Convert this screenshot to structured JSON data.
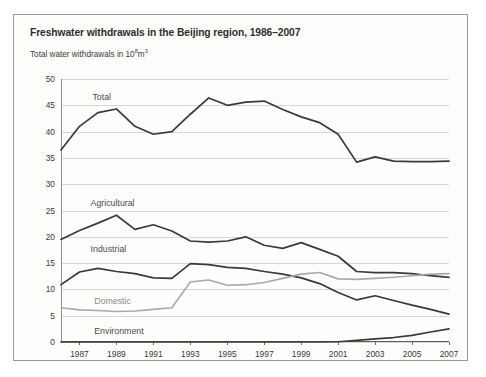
{
  "figure": {
    "title": "Freshwater withdrawals in the Beijing region, 1986–2007",
    "subtitle_prefix": "Total water withdrawals in 10",
    "subtitle_exp1": "8",
    "subtitle_mid": "m",
    "subtitle_exp2": "3"
  },
  "chart_data": {
    "type": "line",
    "title": "Freshwater withdrawals in the Beijing region, 1986–2007",
    "subtitle": "Total water withdrawals in 10⁸m³",
    "xlabel": "",
    "ylabel": "",
    "ylim": [
      0,
      50
    ],
    "ytick_values": [
      0,
      5,
      10,
      15,
      20,
      25,
      30,
      35,
      40,
      45,
      50
    ],
    "ytick_labels": [
      "0",
      "5",
      "10",
      "15",
      "20",
      "25",
      "30",
      "35",
      "40",
      "45",
      "50"
    ],
    "xlim": [
      1986,
      2007
    ],
    "x": [
      1986,
      1987,
      1988,
      1989,
      1990,
      1991,
      1992,
      1993,
      1994,
      1995,
      1996,
      1997,
      1998,
      1999,
      2000,
      2001,
      2002,
      2003,
      2004,
      2005,
      2006,
      2007
    ],
    "xtick_values": [
      1987,
      1989,
      1991,
      1993,
      1995,
      1997,
      1999,
      2001,
      2003,
      2005,
      2007
    ],
    "xtick_labels": [
      "1987",
      "1989",
      "1991",
      "1993",
      "1995",
      "1997",
      "1999",
      "2001",
      "2003",
      "2005",
      "2007"
    ],
    "grid": true,
    "grid_axis": "y",
    "legend_position": "inline-labels",
    "series": [
      {
        "name": "Total",
        "color": "#3a3a38",
        "width": 1.7,
        "label_x": 1987.7,
        "label_y": 46.6,
        "values": [
          36.5,
          41.0,
          43.6,
          44.3,
          41.0,
          39.5,
          40.0,
          43.3,
          46.4,
          45.0,
          45.6,
          45.8,
          44.2,
          42.8,
          41.7,
          39.5,
          34.2,
          35.2,
          34.4,
          34.3,
          34.3,
          34.4
        ]
      },
      {
        "name": "Agricultural",
        "color": "#3a3a38",
        "width": 1.7,
        "label_x": 1987.6,
        "label_y": 26.4,
        "values": [
          19.5,
          21.2,
          22.6,
          24.1,
          21.4,
          22.3,
          21.1,
          19.2,
          19.0,
          19.2,
          20.0,
          18.4,
          17.8,
          18.9,
          17.6,
          16.3,
          13.4,
          13.2,
          13.2,
          13.0,
          12.6,
          12.3
        ]
      },
      {
        "name": "Industrial",
        "color": "#3a3a38",
        "width": 1.7,
        "label_x": 1987.6,
        "label_y": 17.6,
        "values": [
          10.9,
          13.3,
          14.0,
          13.4,
          13.0,
          12.2,
          12.1,
          14.9,
          14.7,
          14.2,
          14.0,
          13.4,
          12.9,
          12.2,
          11.1,
          9.4,
          8.0,
          8.8,
          7.9,
          7.0,
          6.2,
          5.3
        ]
      },
      {
        "name": "Domestic",
        "color": "#a9a9a6",
        "width": 1.6,
        "label_x": 1987.8,
        "label_y": 7.7,
        "values": [
          6.5,
          6.1,
          6.0,
          5.8,
          5.9,
          6.2,
          6.5,
          11.4,
          11.8,
          10.8,
          10.9,
          11.3,
          12.1,
          12.9,
          13.2,
          12.0,
          11.9,
          12.1,
          12.3,
          12.6,
          12.9,
          13.0
        ]
      },
      {
        "name": "Environment",
        "color": "#3a3a38",
        "width": 1.7,
        "label_x": 1987.8,
        "label_y": 2.1,
        "values": [
          0.0,
          0.0,
          0.0,
          0.0,
          0.0,
          0.0,
          0.0,
          0.0,
          0.0,
          0.0,
          0.0,
          0.0,
          0.0,
          0.0,
          0.0,
          0.05,
          0.3,
          0.6,
          0.85,
          1.25,
          1.9,
          2.5
        ]
      }
    ]
  }
}
